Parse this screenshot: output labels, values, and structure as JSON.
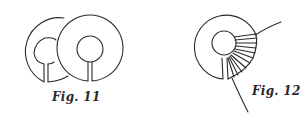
{
  "figures": [
    {
      "id": "fig11",
      "caption": "Fig. 11",
      "description": "Two overlapping split rings (washers) each with a central hole and a radial slit"
    },
    {
      "id": "fig12",
      "caption": "Fig. 12",
      "description": "Single split ring with fan of wrapped strands on lower right and a trailing thread"
    }
  ],
  "colors": {
    "ink": "#2a2a2a",
    "background": "#ffffff"
  }
}
